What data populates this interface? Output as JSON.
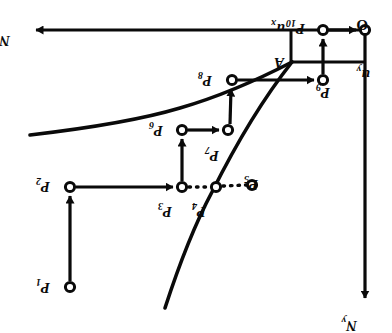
{
  "figure": {
    "background_color": "#ffffff",
    "ink_color": "#0a0a0a",
    "rotation_note": "180",
    "width": 392,
    "height": 333
  },
  "axes": {
    "x_axis_label": "N",
    "x_axis_sub": "x",
    "y_axis_label": "N",
    "y_axis_sub": "y",
    "unit_x_label": "u",
    "unit_x_sub": "x",
    "unit_y_label": "u",
    "unit_y_sub": "y",
    "origin_label": "O"
  },
  "annotations": {
    "junction_label": "A"
  },
  "points": [
    {
      "id": "P1",
      "base": "P",
      "sub": "1",
      "cx": 70,
      "cy": 287,
      "label_x": 50,
      "label_y": 283
    },
    {
      "id": "P2",
      "base": "P",
      "sub": "2",
      "cx": 70,
      "cy": 187,
      "label_x": 50,
      "label_y": 182
    },
    {
      "id": "P3",
      "base": "P",
      "sub": "3",
      "cx": 182,
      "cy": 187,
      "label_x": 172,
      "label_y": 207
    },
    {
      "id": "P4",
      "base": "P",
      "sub": "4",
      "cx": 216,
      "cy": 187,
      "label_x": 206,
      "label_y": 207
    },
    {
      "id": "P5",
      "base": "P",
      "sub": "5",
      "cx": 252,
      "cy": 185,
      "label_x": 258,
      "label_y": 180
    },
    {
      "id": "P6",
      "base": "P",
      "sub": "6",
      "cx": 182,
      "cy": 130,
      "label_x": 163,
      "label_y": 126
    },
    {
      "id": "P7",
      "base": "P",
      "sub": "7",
      "cx": 228,
      "cy": 130,
      "label_x": 219,
      "label_y": 151
    },
    {
      "id": "P8",
      "base": "P",
      "sub": "8",
      "cx": 232,
      "cy": 80,
      "label_x": 212,
      "label_y": 76
    },
    {
      "id": "P9",
      "base": "P",
      "sub": "9",
      "cx": 323,
      "cy": 80,
      "label_x": 330,
      "label_y": 88
    },
    {
      "id": "P10",
      "base": "P",
      "sub": "10",
      "cx": 323,
      "cy": 30,
      "label_x": 305,
      "label_y": 24
    }
  ],
  "connections": [
    {
      "from": "P1",
      "to": "P2",
      "style": "solid",
      "arrow": true
    },
    {
      "from": "P2",
      "to": "P3",
      "style": "solid",
      "arrow": true
    },
    {
      "from": "P3",
      "to": "P4",
      "style": "dotted",
      "arrow": false
    },
    {
      "from": "P4",
      "to": "P5",
      "style": "dotted",
      "arrow": false
    },
    {
      "from": "P3",
      "to": "P6",
      "style": "solid",
      "arrow": true
    },
    {
      "from": "P6",
      "to": "P7",
      "style": "solid",
      "arrow": true
    },
    {
      "from": "P7",
      "to": "P8",
      "style": "solid",
      "arrow": true
    },
    {
      "from": "P8",
      "to": "P9",
      "style": "solid",
      "arrow": true
    },
    {
      "from": "P9",
      "to": "P10",
      "style": "solid",
      "arrow": true
    },
    {
      "from": "P10",
      "to": "O",
      "style": "solid",
      "arrow": true
    }
  ],
  "curves": [
    {
      "name": "upper-curve",
      "description": "shallow curve rising from lower-left to junction A"
    },
    {
      "name": "lower-curve",
      "description": "steep curve rising from bottom-center through P4 to junction A"
    }
  ]
}
